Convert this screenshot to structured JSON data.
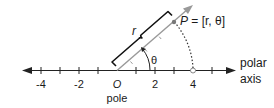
{
  "diagram": {
    "axis": {
      "name_line1": "polar",
      "name_line2": "axis",
      "origin_label": "O",
      "pole_label": "pole",
      "ticks": [
        {
          "value": -4,
          "label": "-4"
        },
        {
          "value": -2,
          "label": "-2"
        },
        {
          "value": 2,
          "label": "2"
        },
        {
          "value": 4,
          "label": "4"
        }
      ]
    },
    "ray": {
      "length_label": "r",
      "angle_label": "θ"
    },
    "point": {
      "label": "P = [r, θ]",
      "name": "P",
      "coords": "= [r, θ]"
    },
    "colors": {
      "axis": "#222222",
      "ray": "#888888",
      "bracket": "#111111",
      "arc": "#333333"
    }
  }
}
